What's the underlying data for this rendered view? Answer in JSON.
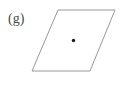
{
  "figure": {
    "label": "(g)",
    "background_color": "#ffffff",
    "shape": {
      "name": "parallelogram",
      "stroke_color": "#8d8d8d",
      "fill_color": "#ffffff",
      "stroke_width": 0.9,
      "vertices": [
        {
          "x": 58,
          "y": 10
        },
        {
          "x": 115,
          "y": 10
        },
        {
          "x": 90,
          "y": 71
        },
        {
          "x": 32,
          "y": 71
        }
      ],
      "points_attr": "58,10 115,10 90,71 32,71"
    },
    "center_point": {
      "name": "center-dot",
      "x": 73.5,
      "y": 40.5,
      "radius": 1.7,
      "color": "#1a1a1a"
    }
  }
}
